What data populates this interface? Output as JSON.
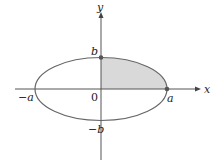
{
  "diagram": {
    "type": "ellipse-quadrant",
    "colors": {
      "background": "#ffffff",
      "axis": "#555555",
      "ellipse_stroke": "#666666",
      "shade_fill": "#d9d9d9",
      "point": "#555555",
      "text": "#222222"
    },
    "axes": {
      "x_label": "x",
      "y_label": "y",
      "origin_label": "0"
    },
    "ellipse": {
      "center": [
        0,
        0
      ],
      "semi_major_label": "a",
      "semi_minor_label": "b"
    },
    "tick_labels": {
      "pos_a": "a",
      "neg_a": "−a",
      "pos_b": "b",
      "neg_b": "−b"
    },
    "highlighted_points": [
      "(0, b)",
      "(a, 0)"
    ],
    "shaded_region": "first quadrant of ellipse interior"
  }
}
